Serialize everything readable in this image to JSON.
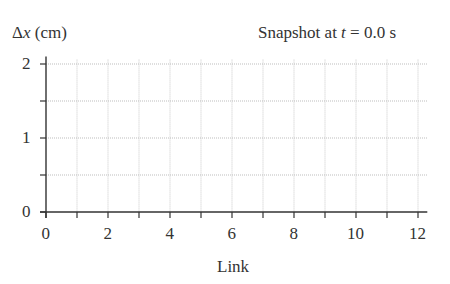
{
  "chart_data": {
    "type": "line",
    "title": "Snapshot at t = 0.0 s",
    "title_parts": {
      "prefix": "Snapshot at ",
      "var": "t",
      "suffix": " = 0.0 s"
    },
    "xlabel": "Link",
    "ylabel": "Δx (cm)",
    "ylabel_parts": {
      "delta": "Δ",
      "var": "x",
      "unit": " (cm)"
    },
    "xlim": [
      0,
      12.3
    ],
    "ylim": [
      0,
      2.1
    ],
    "x_ticks": [
      0,
      2,
      4,
      6,
      8,
      10,
      12
    ],
    "x_minor_ticks": [
      1,
      3,
      5,
      7,
      9,
      11
    ],
    "y_ticks": [
      0,
      1,
      2
    ],
    "y_minor_ticks": [
      0.5,
      1.5
    ],
    "grid": true,
    "series": []
  }
}
